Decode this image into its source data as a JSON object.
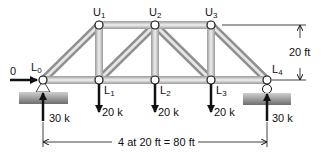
{
  "nodes": {
    "L0": {
      "base": "L",
      "sub": "0"
    },
    "L1": {
      "base": "L",
      "sub": "1"
    },
    "L2": {
      "base": "L",
      "sub": "2"
    },
    "L3": {
      "base": "L",
      "sub": "3"
    },
    "L4": {
      "base": "L",
      "sub": "4"
    },
    "U1": {
      "base": "U",
      "sub": "1"
    },
    "U2": {
      "base": "U",
      "sub": "2"
    },
    "U3": {
      "base": "U",
      "sub": "3"
    }
  },
  "loads": {
    "L1": "20 k",
    "L2": "20 k",
    "L3": "20 k"
  },
  "reactions": {
    "L0_vertical": "30 k",
    "L0_horizontal": "0",
    "L4_vertical": "30 k"
  },
  "dimensions": {
    "height": "20 ft",
    "span": "4 at 20 ft = 80 ft"
  },
  "colors": {
    "member": "#b8b8b8",
    "member_highlight": "#eeeeee",
    "support": "#8a8a8a",
    "line": "#111111"
  }
}
